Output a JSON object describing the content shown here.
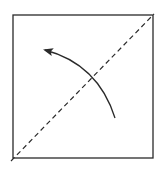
{
  "diagram": {
    "type": "fold-instruction",
    "colors": {
      "background": "#ffffff",
      "stroke": "#2a2a2a"
    },
    "square": {
      "x": 13,
      "y": 15,
      "width": 140,
      "height": 143
    },
    "fold_line": {
      "style": "dashed",
      "from": [
        11,
        161
      ],
      "to": [
        154,
        14
      ]
    },
    "arrow": {
      "from": [
        115,
        118
      ],
      "control": [
        98,
        64
      ],
      "to": [
        44,
        50
      ],
      "head": "arrow-head"
    }
  }
}
